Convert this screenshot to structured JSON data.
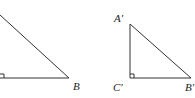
{
  "figure": {
    "left_triangle": {
      "labels": {
        "B": "B"
      },
      "vertices": {
        "top": [
          0,
          15
        ],
        "right_angle": [
          0,
          78
        ],
        "B": [
          69,
          78
        ]
      }
    },
    "right_triangle": {
      "labels": {
        "A": "A′",
        "C": "C′",
        "B": "B′"
      },
      "vertices": {
        "A": [
          130,
          24
        ],
        "C": [
          130,
          78
        ],
        "B": [
          191,
          78
        ]
      }
    },
    "stroke_color": "#333333"
  }
}
